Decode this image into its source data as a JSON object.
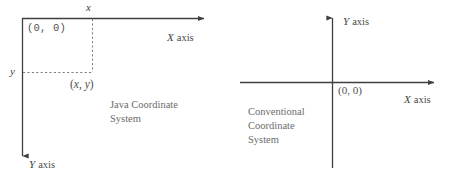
{
  "figure": {
    "background_color": "#ffffff",
    "line_color": "#3f3f3f",
    "dash_color": "#7a7a7a",
    "text_color": "#4f4f4f"
  },
  "diagrams": [
    {
      "id": "java",
      "caption_line1": "Java Coordinate",
      "caption_line2": "System",
      "origin_label": "(0, 0)",
      "point_label_open": "(",
      "point_label_x": "x",
      "point_label_comma": ", ",
      "point_label_y": "y",
      "point_label_close": ")",
      "tick_label_x": "x",
      "tick_label_y": "y",
      "x_axis_letter": "X",
      "x_axis_word": "axis",
      "y_axis_letter": "Y",
      "y_axis_word": "axis",
      "x_axis_direction": "right",
      "y_axis_direction": "down"
    },
    {
      "id": "conventional",
      "caption_line1": "Conventional",
      "caption_line2": "Coordinate",
      "caption_line3": "System",
      "origin_label": "(0, 0)",
      "x_axis_letter": "X",
      "x_axis_word": "axis",
      "y_axis_letter": "Y",
      "y_axis_word": "axis",
      "x_axis_direction": "right",
      "y_axis_direction": "up"
    }
  ]
}
